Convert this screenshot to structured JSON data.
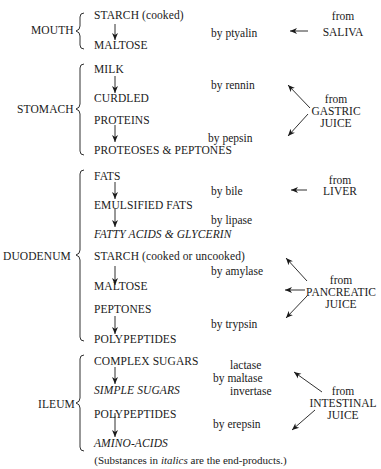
{
  "sections": [
    {
      "organ": "MOUTH",
      "steps": [
        {
          "substance": "STARCH (cooked)",
          "end_product": false
        },
        {
          "substance": "MALTOSE",
          "end_product": false
        }
      ],
      "enzymes": [
        "by ptyalin"
      ],
      "source": {
        "line1": "from",
        "line2": "SALIVA"
      }
    },
    {
      "organ": "STOMACH",
      "steps": [
        {
          "substance": "MILK",
          "end_product": false
        },
        {
          "substance": "CURDLED",
          "end_product": false
        },
        {
          "substance": "PROTEINS",
          "end_product": false
        },
        {
          "substance": "PROTEOSES & PEPTONES",
          "end_product": false
        }
      ],
      "enzymes": [
        "by rennin",
        "by pepsin"
      ],
      "source": {
        "line1": "from",
        "line2": "GASTRIC",
        "line3": "JUICE"
      }
    },
    {
      "organ": "DUODENUM",
      "steps": [
        {
          "substance": "FATS",
          "end_product": false
        },
        {
          "substance": "EMULSIFIED FATS",
          "end_product": false
        },
        {
          "substance": "FATTY ACIDS & GLYCERIN",
          "end_product": true
        },
        {
          "substance": "STARCH (cooked or uncooked)",
          "end_product": false
        },
        {
          "substance": "MALTOSE",
          "end_product": false
        },
        {
          "substance": "PEPTONES",
          "end_product": false
        },
        {
          "substance": "POLYPEPTIDES",
          "end_product": false
        }
      ],
      "enzymes": [
        "by bile",
        "by lipase",
        "by amylase",
        "by trypsin"
      ],
      "sources": [
        {
          "line1": "from",
          "line2": "LIVER"
        },
        {
          "line1": "from",
          "line2": "PANCREATIC",
          "line3": "JUICE"
        }
      ]
    },
    {
      "organ": "ILEUM",
      "steps": [
        {
          "substance": "COMPLEX SUGARS",
          "end_product": false
        },
        {
          "substance": "SIMPLE SUGARS",
          "end_product": true
        },
        {
          "substance": "POLYPEPTIDES",
          "end_product": false
        },
        {
          "substance": "AMINO-ACIDS",
          "end_product": true
        }
      ],
      "enzymes": [
        "lactase",
        "by maltase",
        "invertase",
        "by erepsin"
      ],
      "source": {
        "line1": "from",
        "line2": "INTESTINAL",
        "line3": "JUICE"
      }
    }
  ],
  "footnote": {
    "prefix": "(Substances in ",
    "italic": "italics",
    "suffix": " are the end-products.)"
  }
}
